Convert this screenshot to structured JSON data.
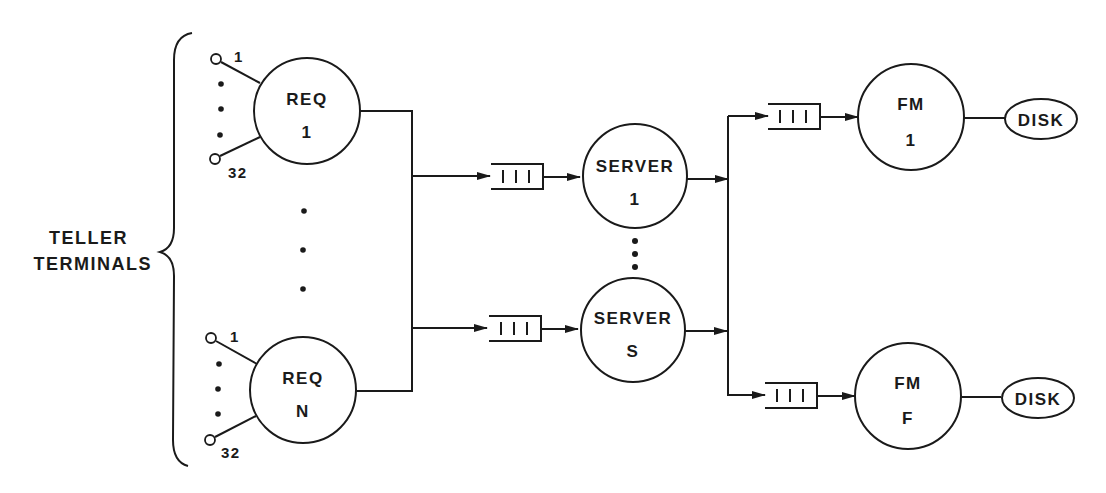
{
  "diagram": {
    "group_label": {
      "line1": "TELLER",
      "line2": "TERMINALS"
    },
    "requesters": [
      {
        "title": "REQ",
        "id": "1",
        "terminal_first": "1",
        "terminal_last": "32"
      },
      {
        "title": "REQ",
        "id": "N",
        "terminal_first": "1",
        "terminal_last": "32"
      }
    ],
    "queue_glyph": "| | |",
    "servers": [
      {
        "title": "SERVER",
        "id": "1"
      },
      {
        "title": "SERVER",
        "id": "S"
      }
    ],
    "file_managers": [
      {
        "title": "FM",
        "id": "1",
        "storage": "DISK"
      },
      {
        "title": "FM",
        "id": "F",
        "storage": "DISK"
      }
    ],
    "colors": {
      "ink": "#1a1a1a",
      "background": "#ffffff"
    }
  }
}
